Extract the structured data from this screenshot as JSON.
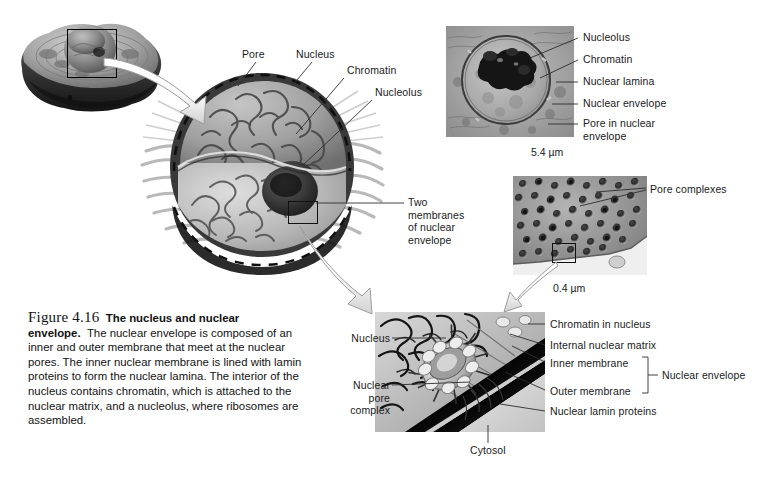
{
  "figure": {
    "number": "Figure 4.16",
    "title": "The nucleus and nuclear envelope.",
    "body": "The nuclear envelope is composed of an inner and outer membrane that meet at the nuclear pores. The inner nuclear membrane is lined with lamin proteins to form the nuclear lamina. The interior of the nucleus contains chromatin, which is attached to the nuclear matrix, and a nucleolus, where ribosomes are assembled."
  },
  "panels": {
    "cell_overview": {
      "name": "whole-cell-illustration"
    },
    "nucleus_cutaway": {
      "name": "nucleus-cutaway-illustration",
      "labels": {
        "pore": "Pore",
        "nucleus": "Nucleus",
        "chromatin": "Chromatin",
        "nucleolus": "Nucleolus",
        "two_membranes": "Two\nmembranes\nof nuclear\nenvelope"
      }
    },
    "tem_nucleus": {
      "name": "tem-nucleus-micrograph",
      "scale": "5.4 µm",
      "labels": {
        "nucleolus": "Nucleolus",
        "chromatin": "Chromatin",
        "nuclear_lamina": "Nuclear lamina",
        "nuclear_envelope": "Nuclear envelope",
        "pore_in_envelope": "Pore in nuclear\nenvelope"
      }
    },
    "freeze_fracture": {
      "name": "freeze-fracture-pore-micrograph",
      "scale": "0.4 µm",
      "labels": {
        "pore_complexes": "Pore complexes"
      }
    },
    "pore_complex_detail": {
      "name": "nuclear-pore-complex-detail-illustration",
      "labels": {
        "nucleus": "Nucleus",
        "nuclear_pore_complex": "Nuclear\npore\ncomplex",
        "chromatin_in_nucleus": "Chromatin in nucleus",
        "internal_nuclear_matrix": "Internal nuclear matrix",
        "inner_membrane": "Inner membrane",
        "outer_membrane": "Outer membrane",
        "nuclear_envelope_bracket": "Nuclear envelope",
        "nuclear_lamin_proteins": "Nuclear lamin proteins",
        "cytosol": "Cytosol"
      }
    }
  },
  "colors": {
    "text": "#1a1a1a",
    "leader": "#333333",
    "background": "#ffffff",
    "artwork_dark": "#3b3b3b",
    "artwork_mid": "#8d8d8d",
    "artwork_light": "#d6d6d6"
  }
}
